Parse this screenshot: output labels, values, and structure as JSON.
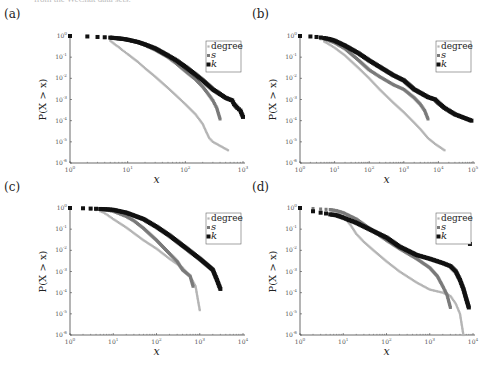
{
  "page": {
    "cut_caption": "from the WeChat data sets."
  },
  "colors": {
    "degree": "#b5b5b5",
    "s": "#7a7a7a",
    "k": "#111111",
    "axis": "#444444",
    "tick_text": "#555555"
  },
  "chart_data": [
    {
      "panel": "(a)",
      "type": "scatter",
      "title": "",
      "xlabel": "x",
      "ylabel": "P(X > x)",
      "xscale": "log",
      "yscale": "log",
      "xlim": [
        1,
        1000
      ],
      "ylim": [
        1e-06,
        1
      ],
      "xticks": [
        "10^0",
        "10^1",
        "10^2",
        "10^3"
      ],
      "yticks": [
        "10^0",
        "10^-1",
        "10^-2",
        "10^-3",
        "10^-4",
        "10^-5",
        "10^-6"
      ],
      "legend": [
        "degree",
        "s",
        "k"
      ],
      "legend_position": "upper right",
      "grid": false,
      "series": [
        {
          "name": "degree",
          "x": [
            1,
            2,
            3,
            4,
            5,
            6,
            7,
            8,
            10,
            15,
            20,
            30,
            50,
            70,
            100,
            150,
            200,
            230,
            260,
            300,
            550
          ],
          "y": [
            1,
            0.95,
            0.9,
            0.8,
            0.6,
            0.4,
            0.3,
            0.22,
            0.14,
            0.06,
            0.03,
            0.012,
            0.0035,
            0.0015,
            0.0006,
            0.0002,
            7e-05,
            3e-05,
            1.5e-05,
            1e-05,
            4e-06
          ]
        },
        {
          "name": "s",
          "x": [
            1,
            2,
            3,
            4,
            5,
            6,
            8,
            10,
            15,
            20,
            30,
            50,
            70,
            100,
            150,
            200,
            250,
            300,
            350,
            400
          ],
          "y": [
            1,
            0.95,
            0.9,
            0.87,
            0.83,
            0.8,
            0.72,
            0.65,
            0.5,
            0.37,
            0.22,
            0.1,
            0.05,
            0.022,
            0.009,
            0.004,
            0.0018,
            0.0009,
            0.0004,
            0.00012
          ]
        },
        {
          "name": "k",
          "x": [
            1,
            2,
            3,
            4,
            5,
            6,
            8,
            10,
            15,
            20,
            30,
            50,
            70,
            100,
            150,
            200,
            300,
            400,
            500,
            650,
            700,
            800,
            900,
            1000
          ],
          "y": [
            1,
            0.95,
            0.9,
            0.87,
            0.84,
            0.8,
            0.74,
            0.67,
            0.52,
            0.4,
            0.26,
            0.12,
            0.07,
            0.035,
            0.015,
            0.008,
            0.003,
            0.0018,
            0.0012,
            0.0009,
            0.0006,
            0.0004,
            0.0003,
            0.00015
          ]
        }
      ]
    },
    {
      "panel": "(b)",
      "type": "scatter",
      "title": "",
      "xlabel": "x",
      "ylabel": "P(X > x)",
      "xscale": "log",
      "yscale": "log",
      "xlim": [
        1,
        100000
      ],
      "ylim": [
        1e-06,
        1
      ],
      "xticks": [
        "10^0",
        "10^1",
        "10^2",
        "10^3",
        "10^4",
        "10^5"
      ],
      "yticks": [
        "10^0",
        "10^-1",
        "10^-2",
        "10^-3",
        "10^-4",
        "10^-5",
        "10^-6"
      ],
      "legend": [
        "degree",
        "s",
        "k"
      ],
      "legend_position": "upper right",
      "grid": false,
      "series": [
        {
          "name": "degree",
          "x": [
            1,
            2,
            3,
            4,
            5,
            7,
            10,
            20,
            50,
            100,
            200,
            500,
            1000,
            2000,
            3000,
            5000,
            8000,
            15000
          ],
          "y": [
            1,
            0.9,
            0.8,
            0.7,
            0.55,
            0.4,
            0.28,
            0.12,
            0.03,
            0.01,
            0.003,
            0.0007,
            0.00025,
            8e-05,
            4e-05,
            1.5e-05,
            8e-06,
            4e-06
          ]
        },
        {
          "name": "s",
          "x": [
            1,
            2,
            3,
            4,
            5,
            7,
            10,
            20,
            50,
            100,
            200,
            500,
            1000,
            2000,
            3000,
            4000,
            5000
          ],
          "y": [
            1,
            0.95,
            0.9,
            0.8,
            0.72,
            0.6,
            0.48,
            0.25,
            0.07,
            0.025,
            0.012,
            0.005,
            0.003,
            0.0012,
            0.0006,
            0.0003,
            0.00012
          ]
        },
        {
          "name": "k",
          "x": [
            1,
            2,
            3,
            4,
            5,
            7,
            10,
            20,
            50,
            100,
            200,
            500,
            1000,
            2000,
            5000,
            8000,
            10000,
            15000,
            20000,
            30000,
            90000
          ],
          "y": [
            1,
            0.95,
            0.9,
            0.85,
            0.8,
            0.72,
            0.6,
            0.35,
            0.15,
            0.07,
            0.035,
            0.014,
            0.008,
            0.003,
            0.0013,
            0.001,
            0.0007,
            0.0004,
            0.0003,
            0.0002,
            0.0001
          ]
        }
      ]
    },
    {
      "panel": "(c)",
      "type": "scatter",
      "title": "",
      "xlabel": "x",
      "ylabel": "P(X > x)",
      "xscale": "log",
      "yscale": "log",
      "xlim": [
        1,
        10000
      ],
      "ylim": [
        1e-06,
        1
      ],
      "xticks": [
        "10^0",
        "10^1",
        "10^2",
        "10^3",
        "10^4"
      ],
      "yticks": [
        "10^0",
        "10^-1",
        "10^-2",
        "10^-3",
        "10^-4",
        "10^-5",
        "10^-6"
      ],
      "legend": [
        "degree",
        "s",
        "k"
      ],
      "legend_position": "upper right",
      "grid": false,
      "series": [
        {
          "name": "degree",
          "x": [
            1,
            2,
            3,
            4,
            5,
            6,
            7,
            10,
            20,
            50,
            100,
            200,
            400,
            600,
            800,
            900,
            1000
          ],
          "y": [
            1,
            0.95,
            0.9,
            0.8,
            0.7,
            0.6,
            0.5,
            0.3,
            0.12,
            0.03,
            0.012,
            0.004,
            0.0015,
            0.0006,
            0.0002,
            5e-05,
            1.5e-05
          ]
        },
        {
          "name": "s",
          "x": [
            1,
            2,
            3,
            4,
            5,
            7,
            10,
            20,
            30,
            50,
            100,
            200,
            300,
            400,
            600,
            700
          ],
          "y": [
            1,
            0.95,
            0.92,
            0.88,
            0.85,
            0.8,
            0.7,
            0.4,
            0.25,
            0.11,
            0.03,
            0.007,
            0.003,
            0.0012,
            0.0006,
            0.0002
          ]
        },
        {
          "name": "k",
          "x": [
            1,
            2,
            3,
            4,
            5,
            7,
            10,
            20,
            50,
            100,
            200,
            500,
            1000,
            1500,
            2000,
            2500,
            3000
          ],
          "y": [
            1,
            0.97,
            0.94,
            0.92,
            0.9,
            0.87,
            0.82,
            0.6,
            0.3,
            0.13,
            0.05,
            0.012,
            0.004,
            0.002,
            0.0012,
            0.0004,
            0.00015
          ]
        }
      ]
    },
    {
      "panel": "(d)",
      "type": "scatter",
      "title": "",
      "xlabel": "x",
      "ylabel": "P(X > x)",
      "xscale": "log",
      "yscale": "log",
      "xlim": [
        1,
        10000
      ],
      "ylim": [
        1e-06,
        1
      ],
      "xticks": [
        "10^0",
        "10^1",
        "10^2",
        "10^3",
        "10^4"
      ],
      "yticks": [
        "10^0",
        "10^-1",
        "10^-2",
        "10^-3",
        "10^-4",
        "10^-5",
        "10^-6"
      ],
      "legend": [
        "degree",
        "s",
        "k"
      ],
      "legend_position": "upper right",
      "grid": false,
      "series": [
        {
          "name": "degree",
          "x": [
            1,
            2,
            3,
            4,
            5,
            7,
            10,
            15,
            20,
            30,
            50,
            100,
            200,
            500,
            1000,
            2000,
            3000,
            4000,
            5000,
            5500,
            6000
          ],
          "y": [
            1,
            0.9,
            0.85,
            0.8,
            0.75,
            0.6,
            0.4,
            0.15,
            0.06,
            0.025,
            0.01,
            0.003,
            0.001,
            0.0003,
            0.00014,
            0.0001,
            7e-05,
            3e-05,
            1e-05,
            3e-06,
            1e-06
          ]
        },
        {
          "name": "s",
          "x": [
            1,
            2,
            3,
            4,
            5,
            7,
            10,
            20,
            50,
            100,
            200,
            500,
            1000,
            1500,
            2000,
            2500,
            3000
          ],
          "y": [
            1,
            0.95,
            0.9,
            0.87,
            0.85,
            0.75,
            0.6,
            0.3,
            0.08,
            0.03,
            0.012,
            0.004,
            0.0015,
            0.0006,
            0.0002,
            8e-05,
            2e-05
          ]
        },
        {
          "name": "k",
          "x": [
            1,
            2,
            3,
            4,
            5,
            7,
            10,
            20,
            50,
            100,
            200,
            500,
            1000,
            2000,
            3000,
            4000,
            5000,
            6000,
            7000,
            8000,
            8500
          ],
          "y": [
            1,
            0.7,
            0.6,
            0.55,
            0.5,
            0.45,
            0.35,
            0.2,
            0.08,
            0.04,
            0.015,
            0.006,
            0.004,
            0.0025,
            0.0018,
            0.001,
            0.0004,
            0.00015,
            5e-05,
            2e-05,
            0.02
          ]
        }
      ]
    }
  ],
  "layout_panels": [
    {
      "label_pos": [
        4,
        18
      ],
      "plot": [
        70,
        36,
        243,
        163
      ]
    },
    {
      "label_pos": [
        252,
        18
      ],
      "plot": [
        300,
        36,
        473,
        163
      ]
    },
    {
      "label_pos": [
        4,
        191
      ],
      "plot": [
        70,
        208,
        243,
        335
      ]
    },
    {
      "label_pos": [
        252,
        191
      ],
      "plot": [
        300,
        208,
        473,
        335
      ]
    }
  ]
}
